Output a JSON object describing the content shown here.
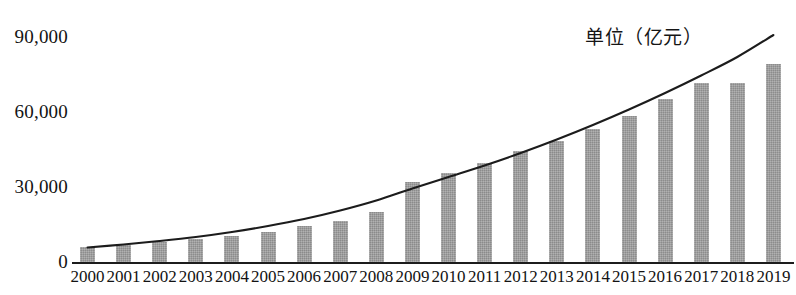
{
  "chart_data": {
    "type": "bar",
    "title": "",
    "subtitle": "",
    "xlabel": "",
    "ylabel": "",
    "annotation": "单位（亿元）",
    "categories": [
      "2000",
      "2001",
      "2002",
      "2003",
      "2004",
      "2005",
      "2006",
      "2007",
      "2008",
      "2009",
      "2010",
      "2011",
      "2012",
      "2013",
      "2014",
      "2015",
      "2016",
      "2017",
      "2018",
      "2019"
    ],
    "values": [
      6000,
      6800,
      8000,
      9200,
      10400,
      12000,
      14400,
      16400,
      20000,
      32000,
      35600,
      39600,
      44400,
      48400,
      53200,
      58400,
      65200,
      71600,
      71600,
      79200
    ],
    "series": [
      {
        "name": "bars",
        "values": [
          6000,
          6800,
          8000,
          9200,
          10400,
          12000,
          14400,
          16400,
          20000,
          32000,
          35600,
          39600,
          44400,
          48400,
          53200,
          58400,
          65200,
          71600,
          71600,
          79200
        ]
      },
      {
        "name": "trend-curve",
        "type": "line",
        "values": [
          5800,
          7000,
          8400,
          10000,
          12000,
          14400,
          17200,
          20600,
          24600,
          29400,
          34000,
          38600,
          43600,
          49000,
          54800,
          61000,
          67600,
          74600,
          82000,
          90800
        ]
      }
    ],
    "y_ticks": [
      "0",
      "30,000",
      "60,000",
      "90,000"
    ],
    "y_tick_values": [
      0,
      30000,
      60000,
      90000
    ],
    "ylim": [
      0,
      90000
    ],
    "grid": false,
    "legend": "none",
    "colors": {
      "bar": "#9c9c9c",
      "curve": "#1c1c1c",
      "axis": "#1c1c1c",
      "text": "#131313",
      "background": "#ffffff"
    }
  }
}
